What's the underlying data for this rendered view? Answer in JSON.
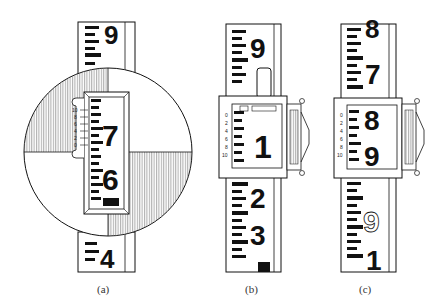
{
  "figures": [
    {
      "id": "a",
      "caption": "(a)",
      "type": "rod-with-circular-target",
      "rod_numerals_outside": [
        "9",
        "4"
      ],
      "window_numerals": [
        "7",
        "6",
        "5"
      ],
      "vernier_scale_labels": [
        "10",
        "8",
        "6",
        "4",
        "2",
        "0"
      ]
    },
    {
      "id": "b",
      "caption": "(b)",
      "type": "rod-with-rectangular-target",
      "rod_numerals_outside": [
        "9",
        "0",
        "2",
        "3",
        "4"
      ],
      "window_numerals": [
        "1"
      ],
      "vernier_scale_labels": [
        "0",
        "2",
        "4",
        "6",
        "8",
        "10"
      ]
    },
    {
      "id": "c",
      "caption": "(c)",
      "type": "rod-with-rectangular-target",
      "rod_numerals_outside": [
        "8",
        "7",
        "9",
        "1"
      ],
      "window_numerals": [
        "8",
        "9"
      ],
      "vernier_scale_labels": [
        "0",
        "2",
        "4",
        "6",
        "8",
        "10"
      ]
    }
  ],
  "colors": {
    "ink": "#111111",
    "paper": "#ffffff",
    "hatch": "#888888"
  }
}
